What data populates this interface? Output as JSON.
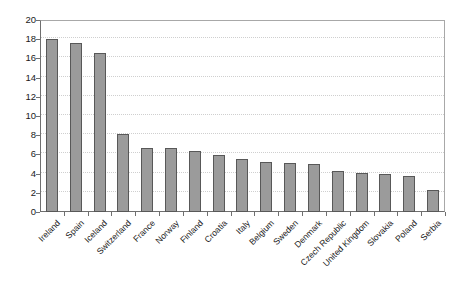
{
  "chart_data": {
    "type": "bar",
    "title": "",
    "subtitle": "",
    "xlabel": "",
    "ylabel": "",
    "ylim": [
      0,
      20
    ],
    "yticks": [
      0,
      2,
      4,
      6,
      8,
      10,
      12,
      14,
      16,
      18,
      20
    ],
    "grid": true,
    "legend": "none",
    "bar_color": "#9b9b9b",
    "bar_border_color": "#585858",
    "categories": [
      "Ireland",
      "Spain",
      "Iceland",
      "Switzerland",
      "France",
      "Norway",
      "Finland",
      "Croatia",
      "Italy",
      "Belgium",
      "Sweden",
      "Denmark",
      "Czech Republic",
      "United Kingdom",
      "Slovakia",
      "Poland",
      "Serbia"
    ],
    "values": [
      18.0,
      17.6,
      16.6,
      8.1,
      6.7,
      6.65,
      6.4,
      5.9,
      5.5,
      5.25,
      5.1,
      5.05,
      4.3,
      4.1,
      4.0,
      3.7,
      2.3
    ]
  }
}
